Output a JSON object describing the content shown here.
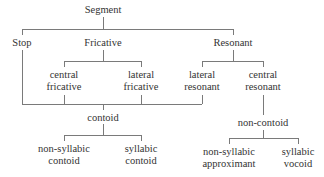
{
  "diagram": {
    "type": "tree",
    "colors": {
      "line": "#7a7a7a",
      "text": "#333333",
      "background": "#ffffff"
    },
    "nodes": {
      "segment": "Segment",
      "stop": "Stop",
      "fricative": "Fricative",
      "resonant": "Resonant",
      "central_fricative": {
        "line1": "central",
        "line2": "fricative"
      },
      "lateral_fricative": {
        "line1": "lateral",
        "line2": "fricative"
      },
      "lateral_resonant": {
        "line1": "lateral",
        "line2": "resonant"
      },
      "central_resonant": {
        "line1": "central",
        "line2": "resonant"
      },
      "contoid": "contoid",
      "non_contoid": "non-contoid",
      "non_syllabic_contoid": {
        "line1": "non-syllabic",
        "line2": "contoid"
      },
      "syllabic_contoid": {
        "line1": "syllabic",
        "line2": "contoid"
      },
      "non_syllabic_approximant": {
        "line1": "non-syllabic",
        "line2": "approximant"
      },
      "syllabic_vocoid": {
        "line1": "syllabic",
        "line2": "vocoid"
      }
    },
    "edges": [
      [
        "Segment",
        "Stop"
      ],
      [
        "Segment",
        "Fricative"
      ],
      [
        "Segment",
        "Resonant"
      ],
      [
        "Fricative",
        "central fricative"
      ],
      [
        "Fricative",
        "lateral fricative"
      ],
      [
        "Resonant",
        "lateral resonant"
      ],
      [
        "Resonant",
        "central resonant"
      ],
      [
        "Stop",
        "contoid"
      ],
      [
        "central fricative",
        "contoid"
      ],
      [
        "lateral fricative",
        "contoid"
      ],
      [
        "lateral resonant",
        "contoid"
      ],
      [
        "central resonant",
        "non-contoid"
      ],
      [
        "contoid",
        "non-syllabic contoid"
      ],
      [
        "contoid",
        "syllabic contoid"
      ],
      [
        "non-contoid",
        "non-syllabic approximant"
      ],
      [
        "non-contoid",
        "syllabic vocoid"
      ]
    ]
  }
}
